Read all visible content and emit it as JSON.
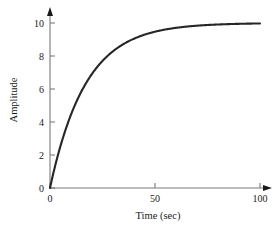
{
  "chart_data": {
    "type": "line",
    "title": "",
    "subtitle": "",
    "xlabel": "Time (sec)",
    "ylabel": "Amplitude",
    "xlim": [
      0,
      100
    ],
    "ylim": [
      0,
      10
    ],
    "xticks": [
      0,
      50,
      100
    ],
    "xtick_labels": [
      "0",
      "50",
      "100"
    ],
    "yticks": [
      0,
      2,
      4,
      6,
      8,
      10
    ],
    "ytick_labels": [
      "0",
      "2",
      "4",
      "6",
      "8",
      "10"
    ],
    "grid": false,
    "legend": false,
    "legend_position": "none",
    "axis_arrows": true,
    "tick_direction": "in",
    "colors": {
      "curve": "#262626",
      "axis": "#7a7a7a",
      "text": "#1a1a1a",
      "background": "#ffffff"
    },
    "series": [
      {
        "name": "step response",
        "equation": "y = 10 * (1 - exp(-t/17))",
        "steady_state": 10,
        "time_constant": 17,
        "x": [
          0,
          2,
          4,
          6,
          8,
          10,
          12,
          14,
          16,
          18,
          20,
          25,
          30,
          35,
          40,
          45,
          50,
          55,
          60,
          65,
          70,
          75,
          80,
          85,
          90,
          95,
          100
        ],
        "values": [
          0,
          1.11,
          2.1,
          2.98,
          3.76,
          4.46,
          5.08,
          5.63,
          6.12,
          6.55,
          6.94,
          7.74,
          8.3,
          8.71,
          9.04,
          9.28,
          9.46,
          9.6,
          9.7,
          9.78,
          9.83,
          9.87,
          9.91,
          9.93,
          9.95,
          9.96,
          9.97
        ]
      }
    ]
  },
  "axis_titles": {
    "x": "Time (sec)",
    "y": "Amplitude"
  }
}
